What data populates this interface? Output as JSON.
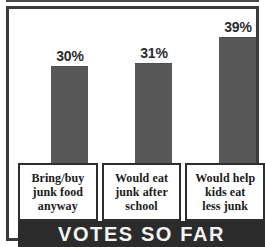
{
  "chart_data": {
    "type": "bar",
    "title": "",
    "xlabel": "",
    "ylabel": "",
    "ylim": [
      0,
      45
    ],
    "grid": false,
    "legend": "none",
    "categories": [
      "Bring/buy junk food anyway",
      "Would eat junk after school",
      "Would help kids eat less junk"
    ],
    "values": [
      30,
      31,
      39
    ],
    "value_labels": [
      "30%",
      "31%",
      "39%"
    ],
    "bars": [
      {
        "value": 30,
        "value_label": "30%",
        "category_lines": [
          "Bring/buy",
          "junk food",
          "anyway"
        ]
      },
      {
        "value": 31,
        "value_label": "31%",
        "category_lines": [
          "Would eat",
          "junk after",
          "school"
        ]
      },
      {
        "value": 39,
        "value_label": "39%",
        "category_lines": [
          "Would help",
          "kids eat",
          "less junk"
        ]
      }
    ],
    "footer_banner": "VOTES SO FAR",
    "colors": {
      "bar_fill": "#585858",
      "frame": "#3b3b3b",
      "banner_background": "#2b2b2b",
      "banner_text": "#f4f4f4",
      "label_box_border": "#2e2e2e",
      "background": "#ffffff",
      "value_text": "#2b2b2b",
      "category_text": "#1a1a1a"
    }
  }
}
